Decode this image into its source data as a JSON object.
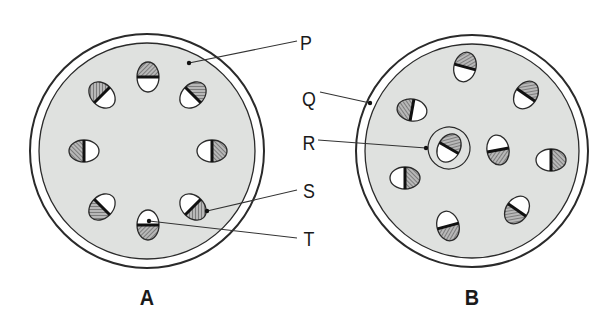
{
  "figure": {
    "type": "comparative cross-section diagram (stem cross-sections)",
    "panels": [
      {
        "id": "A",
        "caption": "A",
        "center": [
          147,
          151
        ],
        "outer_radius": 117,
        "inner_radius": 108,
        "bundles": [
          {
            "cx": 148,
            "cy": 77,
            "angle": 0,
            "hatched_side": "top"
          },
          {
            "cx": 193,
            "cy": 95,
            "angle": 45,
            "hatched_side": "top"
          },
          {
            "cx": 212,
            "cy": 151,
            "angle": 90,
            "hatched_side": "right"
          },
          {
            "cx": 193,
            "cy": 207,
            "angle": 135,
            "hatched_side": "right"
          },
          {
            "cx": 148,
            "cy": 225,
            "angle": 180,
            "hatched_side": "bottom"
          },
          {
            "cx": 102,
            "cy": 207,
            "angle": 225,
            "hatched_side": "bottom"
          },
          {
            "cx": 84,
            "cy": 151,
            "angle": 270,
            "hatched_side": "left"
          },
          {
            "cx": 102,
            "cy": 95,
            "angle": 315,
            "hatched_side": "left"
          }
        ]
      },
      {
        "id": "B",
        "caption": "B",
        "center": [
          472,
          151
        ],
        "outer_radius": 116,
        "inner_radius": 107,
        "bundles": [
          {
            "cx": 465,
            "cy": 67,
            "angle": 15,
            "hatched_side": "top"
          },
          {
            "cx": 526,
            "cy": 95,
            "angle": 35,
            "hatched_side": "top"
          },
          {
            "cx": 412,
            "cy": 110,
            "angle": 280,
            "hatched_side": "left"
          },
          {
            "cx": 449,
            "cy": 148,
            "angle": 30,
            "hatched_side": "top",
            "circled": true
          },
          {
            "cx": 498,
            "cy": 150,
            "angle": 170,
            "hatched_side": "bottom"
          },
          {
            "cx": 551,
            "cy": 160,
            "angle": 90,
            "hatched_side": "right"
          },
          {
            "cx": 405,
            "cy": 178,
            "angle": 90,
            "hatched_side": "right"
          },
          {
            "cx": 517,
            "cy": 210,
            "angle": 215,
            "hatched_side": "left"
          },
          {
            "cx": 448,
            "cy": 226,
            "angle": 165,
            "hatched_side": "bottom"
          }
        ]
      }
    ],
    "labels": [
      {
        "text": "P",
        "x": 306,
        "y": 42
      },
      {
        "text": "Q",
        "x": 309,
        "y": 98
      },
      {
        "text": "R",
        "x": 309,
        "y": 142
      },
      {
        "text": "S",
        "x": 309,
        "y": 190
      },
      {
        "text": "T",
        "x": 309,
        "y": 238
      }
    ],
    "leader_lines": [
      {
        "label": "P",
        "from": [
          297,
          41
        ],
        "to": [
          189,
          63
        ],
        "target_panel": "A",
        "points_to": "ground tissue (pith/cortex)"
      },
      {
        "label": "Q",
        "from": [
          320,
          92
        ],
        "to": [
          370,
          103
        ],
        "target_panel": "B",
        "points_to": "epidermis / outer ring"
      },
      {
        "label": "R",
        "from": [
          318,
          140
        ],
        "to": [
          426,
          148
        ],
        "target_panel": "B",
        "points_to": "bundle sheath around vascular bundle"
      },
      {
        "label": "S",
        "from": [
          297,
          190
        ],
        "to": [
          207,
          211
        ],
        "target_panel": "A",
        "points_to": "hatched half (phloem/xylem) of vascular bundle"
      },
      {
        "label": "T",
        "from": [
          297,
          238
        ],
        "to": [
          149,
          221
        ],
        "target_panel": "A",
        "points_to": "white half of vascular bundle"
      }
    ]
  },
  "colors": {
    "ground_tissue": "#dfe1df",
    "outline": "#2a2a2a",
    "hatch": "#5a5a5a",
    "bundle_fill": "#ffffff",
    "divider": "#111111",
    "background": "#ffffff"
  }
}
